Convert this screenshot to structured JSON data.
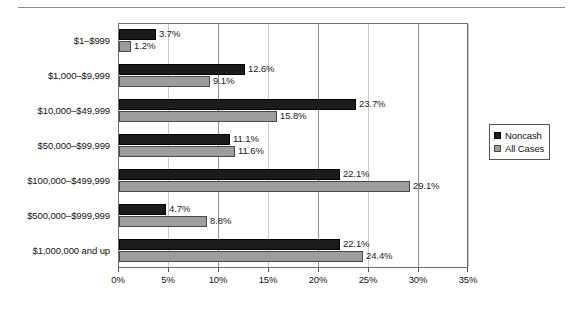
{
  "chart_data": {
    "type": "bar",
    "orientation": "horizontal",
    "title": "",
    "subtitle": "",
    "xlabel": "",
    "ylabel": "",
    "xlim": [
      0,
      35
    ],
    "xtick_labels": [
      "0%",
      "5%",
      "10%",
      "15%",
      "20%",
      "25%",
      "30%",
      "35%"
    ],
    "xtick_values": [
      0,
      5,
      10,
      15,
      20,
      25,
      30,
      35
    ],
    "grid": "vertical",
    "legend_position": "right",
    "categories": [
      "$1–$999",
      "$1,000–$9,999",
      "$10,000–$49,999",
      "$50,000–$99,999",
      "$100,000–$499,999",
      "$500,000–$999,999",
      "$1,000,000 and up"
    ],
    "series": [
      {
        "name": "Noncash",
        "color": "#1c1c1c",
        "values": [
          3.7,
          12.6,
          23.7,
          11.1,
          22.1,
          4.7,
          22.1
        ],
        "labels": [
          "3.7%",
          "12.6%",
          "23.7%",
          "11.1%",
          "22.1%",
          "4.7%",
          "22.1%"
        ]
      },
      {
        "name": "All Cases",
        "color": "#9d9d9d",
        "values": [
          1.2,
          9.1,
          15.8,
          11.6,
          29.1,
          8.8,
          24.4
        ],
        "labels": [
          "1.2%",
          "9.1%",
          "15.8%",
          "11.6%",
          "29.1%",
          "8.8%",
          "24.4%"
        ]
      }
    ]
  },
  "legend": {
    "items": [
      {
        "label": "Noncash"
      },
      {
        "label": "All Cases"
      }
    ]
  }
}
